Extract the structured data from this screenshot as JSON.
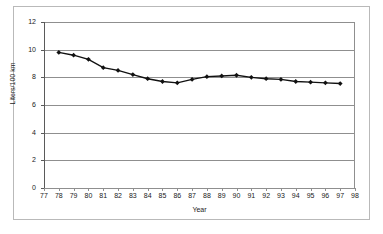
{
  "chart_data": {
    "type": "line",
    "title": "",
    "xlabel": "Year",
    "ylabel": "Liters/100 km",
    "xlim": [
      77,
      98
    ],
    "ylim": [
      0,
      12
    ],
    "xticks": [
      77,
      78,
      79,
      80,
      81,
      82,
      83,
      84,
      85,
      86,
      87,
      88,
      89,
      90,
      91,
      92,
      93,
      94,
      95,
      96,
      97,
      98
    ],
    "yticks": [
      0,
      2,
      4,
      6,
      8,
      10,
      12
    ],
    "xtick_labels": [
      "77",
      "78",
      "79",
      "80",
      "81",
      "82",
      "83",
      "84",
      "85",
      "86",
      "87",
      "88",
      "89",
      "90",
      "91",
      "92",
      "93",
      "94",
      "95",
      "96",
      "97",
      "98"
    ],
    "ytick_labels": [
      "0",
      "2",
      "4",
      "6",
      "8",
      "10",
      "12"
    ],
    "grid": "horizontal",
    "legend": "none",
    "marker": "diamond",
    "line_color": "#111111",
    "marker_color": "#111111",
    "grid_color": "#8f8f8f",
    "x": [
      78,
      79,
      80,
      81,
      82,
      83,
      84,
      85,
      86,
      87,
      88,
      89,
      90,
      91,
      92,
      93,
      94,
      95,
      96,
      97
    ],
    "values": [
      9.8,
      9.6,
      9.3,
      8.7,
      8.5,
      8.2,
      7.9,
      7.7,
      7.6,
      7.85,
      8.05,
      8.1,
      8.15,
      8.0,
      7.9,
      7.85,
      7.7,
      7.65,
      7.6,
      7.55
    ],
    "series": [
      {
        "name": "Fuel consumption",
        "values": [
          9.8,
          9.6,
          9.3,
          8.7,
          8.5,
          8.2,
          7.9,
          7.7,
          7.6,
          7.85,
          8.05,
          8.1,
          8.15,
          8.0,
          7.9,
          7.85,
          7.7,
          7.65,
          7.6,
          7.55
        ]
      }
    ]
  }
}
